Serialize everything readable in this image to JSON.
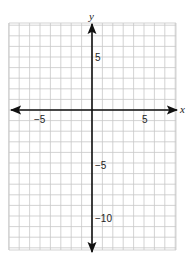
{
  "chart_data": {
    "type": "line",
    "title": "",
    "xlabel": "x",
    "ylabel": "y",
    "xlim": [
      -8,
      8
    ],
    "ylim": [
      -13,
      8
    ],
    "grid": true,
    "grid_step": 1,
    "x_tick_labels": [
      "-5",
      "5"
    ],
    "x_ticks": [
      -5,
      5
    ],
    "y_tick_labels": [
      "5",
      "-5",
      "-10"
    ],
    "y_ticks": [
      5,
      -5,
      -10
    ],
    "series": [],
    "annotations": [],
    "legend": null
  },
  "labels": {
    "x_axis": "x",
    "y_axis": "y",
    "x_neg5": "−5",
    "x_pos5": "5",
    "y_pos5": "5",
    "y_neg5": "−5",
    "y_neg10": "−10"
  },
  "colors": {
    "grid": "#c8c8c8",
    "axis": "#111111",
    "text": "#222222"
  }
}
